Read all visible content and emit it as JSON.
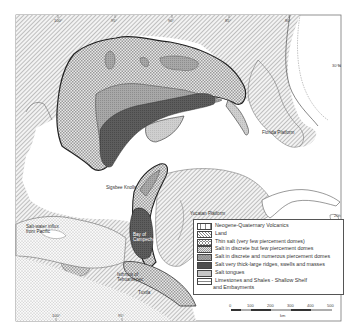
{
  "map": {
    "labels": {
      "sigsbee_knolls": "Sigsbee Knolls",
      "florida_platform": "Florida Platform",
      "yucatan_platform": "Yucatan Platform",
      "bay_of_campeche": "Bay of Campeche",
      "isthmus": "Isthmus of Tehuantepec",
      "salt_water": "Salt-water influx from Pacific",
      "campeche_escarpment": "Campeche Escarpment",
      "florida": "Florida",
      "tuxtla": "Tuxtla"
    },
    "ticks": {
      "top": [
        "100°",
        "95°",
        "90°",
        "85°",
        "80°"
      ],
      "bottom": [
        "100°",
        "95°"
      ],
      "right": [
        "30°N",
        "20°"
      ]
    }
  },
  "legend": {
    "items": [
      {
        "label": "Neogene-Quaternary Volcanics",
        "pattern": "vcross"
      },
      {
        "label": "Land",
        "pattern": "diag"
      },
      {
        "label": "Thin salt (very few piercement domes)",
        "pattern": "circles"
      },
      {
        "label": "Salt in discrete but few piercement domes",
        "pattern": "dots"
      },
      {
        "label": "Salt in discrete and numerous piercement domes",
        "pattern": "cross"
      },
      {
        "label": "Salt very thick-large ridges, swells and masses",
        "pattern": "dark"
      },
      {
        "label": "Salt tongues",
        "pattern": "light"
      },
      {
        "label": "Limestones and Shales - Shallow Shelf",
        "label2": "and Embayments",
        "pattern": "brick"
      }
    ]
  },
  "scale": {
    "ticks": [
      "0",
      "100",
      "200",
      "300",
      "400",
      "500"
    ],
    "unit": "km"
  }
}
